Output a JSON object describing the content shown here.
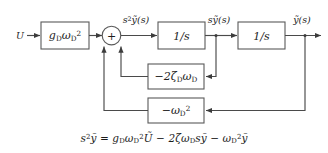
{
  "diagram": {
    "input_label": "U",
    "blocks": [
      {
        "id": "gain",
        "label_html": "g<sub>D</sub>ω<sub>D</sub><sup>2</sup>",
        "label_text": "gD ωD²"
      },
      {
        "id": "integrator1",
        "label_html": "1/s",
        "label_text": "1/s"
      },
      {
        "id": "integrator2",
        "label_html": "1/s",
        "label_text": "1/s"
      },
      {
        "id": "damping",
        "label_html": "−2ζ<sub>D</sub>ω<sub>D</sub>",
        "label_text": "−2ζD ωD"
      },
      {
        "id": "stiffness",
        "label_html": "−ω<sub>D</sub><sup>2</sup>",
        "label_text": "−ωD²"
      }
    ],
    "summing_junction": {
      "sign": "+"
    },
    "signals": [
      {
        "id": "accel",
        "label_html": "s<sup>2</sup>ỹ(s)",
        "label_text": "s²ỹ(s)"
      },
      {
        "id": "velocity",
        "label_html": "sỹ(s)",
        "label_text": "sỹ(s)"
      },
      {
        "id": "position",
        "label_html": "ỹ(s)",
        "label_text": "ỹ(s)"
      }
    ],
    "equation_html": "s<sup>2</sup>ỹ = g<sub>D</sub>ω<sub>D</sub><sup>2</sup>Ũ − 2ζω<sub>D</sub>sỹ − ω<sub>D</sub><sup>2</sup>ỹ",
    "equation_text": "s²ỹ = gDωD²Ũ − 2ζωD sỹ − ωD²ỹ",
    "colors": {
      "background": "#ffffff",
      "line": "#4a4a4a",
      "block_stroke": "#5a5a5a",
      "text": "#1c1c1c"
    }
  }
}
